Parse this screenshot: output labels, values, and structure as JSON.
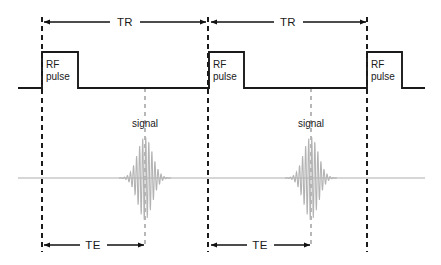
{
  "diagram": {
    "colors": {
      "trace": "#1a1a1a",
      "signal": "#b3b3b3",
      "signal_baseline": "#c9c9c9",
      "dashed_black": "#111111",
      "dashed_gray": "#9a9a9a",
      "background": "#ffffff"
    },
    "intervals": [
      {
        "id": "tr-1",
        "label": "TR",
        "x_start": 42,
        "x_end": 207,
        "y": 22,
        "label_x": 124
      },
      {
        "id": "tr-2",
        "label": "TR",
        "x_start": 209,
        "x_end": 367,
        "y": 22,
        "label_x": 288
      },
      {
        "id": "te-1",
        "label": "TE",
        "x_start": 42,
        "x_end": 145,
        "y": 245,
        "label_x": 93
      },
      {
        "id": "te-2",
        "label": "TE",
        "x_start": 209,
        "x_end": 311,
        "y": 245,
        "label_x": 260
      }
    ],
    "rf_pulses": [
      {
        "id": "rf-1",
        "label_line1": "RF",
        "label_line2": "pulse",
        "x_rise": 42,
        "x_fall": 78
      },
      {
        "id": "rf-2",
        "label_line1": "RF",
        "label_line2": "pulse",
        "x_rise": 209,
        "x_fall": 244
      },
      {
        "id": "rf-3",
        "label_line1": "RF",
        "label_line2": "pulse",
        "x_rise": 367,
        "x_fall": 402
      }
    ],
    "rf_axis": {
      "baseline_y": 88,
      "top_y": 52,
      "x_start": 18,
      "x_end": 425
    },
    "signals": [
      {
        "id": "signal-1",
        "label": "signal",
        "center_x": 145,
        "label_y": 127,
        "half_width": 26,
        "peak_height": 42
      },
      {
        "id": "signal-2",
        "label": "signal",
        "center_x": 311,
        "label_y": 127,
        "half_width": 26,
        "peak_height": 42
      }
    ],
    "signal_axis": {
      "baseline_y": 178,
      "x_start": 18,
      "x_end": 425
    },
    "dashed_lines": [
      {
        "id": "marker-rf1",
        "x": 42,
        "y_top": 17,
        "y_bottom": 252,
        "color": "black"
      },
      {
        "id": "marker-rf2",
        "x": 208,
        "y_top": 17,
        "y_bottom": 252,
        "color": "black"
      },
      {
        "id": "marker-rf3",
        "x": 367,
        "y_top": 17,
        "y_bottom": 252,
        "color": "black"
      },
      {
        "id": "marker-echo1",
        "x": 145,
        "y_top": 88,
        "y_bottom": 248,
        "color": "gray"
      },
      {
        "id": "marker-echo2",
        "x": 311,
        "y_top": 88,
        "y_bottom": 248,
        "color": "gray"
      }
    ]
  },
  "chart_data": {
    "type": "line",
    "xlabel": "time",
    "ylabel": "",
    "series": [
      {
        "name": "RF channel",
        "description": "Square RF excitation pulses on a flat baseline",
        "events": [
          {
            "label": "RF pulse",
            "start": 42,
            "end": 78,
            "amplitude": 1
          },
          {
            "label": "RF pulse",
            "start": 209,
            "end": 244,
            "amplitude": 1
          },
          {
            "label": "RF pulse",
            "start": 367,
            "end": 402,
            "amplitude": 1
          }
        ]
      },
      {
        "name": "Signal channel",
        "description": "Damped oscillating spin-echo envelopes",
        "events": [
          {
            "label": "signal",
            "center": 145,
            "amplitude": 1
          },
          {
            "label": "signal",
            "center": 311,
            "amplitude": 1
          }
        ]
      }
    ],
    "annotations": [
      {
        "label": "TR",
        "from": 42,
        "to": 207,
        "meaning": "repetition time"
      },
      {
        "label": "TR",
        "from": 209,
        "to": 367,
        "meaning": "repetition time"
      },
      {
        "label": "TE",
        "from": 42,
        "to": 145,
        "meaning": "echo time"
      },
      {
        "label": "TE",
        "from": 209,
        "to": 311,
        "meaning": "echo time"
      }
    ],
    "grid": false,
    "legend": "none"
  }
}
